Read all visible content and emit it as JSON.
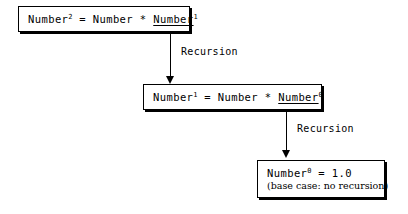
{
  "diagram": {
    "background_color": "#ffffff",
    "line_color": "#000000"
  },
  "boxes": [
    {
      "id": "box-level-2",
      "equation_prefix": "Number",
      "equation_exponent": "2",
      "equation_middle": " = Number * ",
      "equation_call": "Number",
      "equation_call_exponent": "1",
      "full_text": "Number2 = Number * Number1"
    },
    {
      "id": "box-level-1",
      "equation_prefix": "Number",
      "equation_exponent": "1",
      "equation_middle": " = Number * ",
      "equation_call": "Number",
      "equation_call_exponent": "0",
      "full_text": "Number1 = Number * Number0"
    },
    {
      "id": "box-base-case",
      "equation_prefix": "Number",
      "equation_exponent": "0",
      "equation_middle": " = 1.0",
      "note": "(base case: no recursion)",
      "full_text": "Number0 = 1.0 (base case: no recursion)"
    }
  ],
  "arrows": [
    {
      "id": "arrow-1",
      "label": "Recursion",
      "from": "box-level-2",
      "to": "box-level-1"
    },
    {
      "id": "arrow-2",
      "label": "Recursion",
      "from": "box-level-1",
      "to": "box-base-case"
    }
  ]
}
